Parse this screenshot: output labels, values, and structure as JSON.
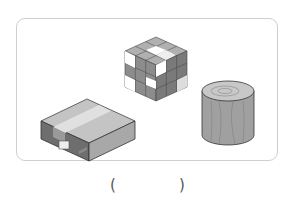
{
  "question": {
    "objects": [
      {
        "name": "cardboard box",
        "shape": "cuboid"
      },
      {
        "name": "rubik's cube",
        "shape": "cube"
      },
      {
        "name": "wooden cylinder",
        "shape": "cylinder"
      }
    ],
    "answer_blank": {
      "open": "(",
      "close": ")"
    }
  },
  "colors": {
    "frame_border": "#cfcfcf",
    "box_top": "#b9b9b9",
    "box_front": "#8a8a8a",
    "box_side": "#a8a8a8",
    "wood": "#9a9a9a"
  }
}
